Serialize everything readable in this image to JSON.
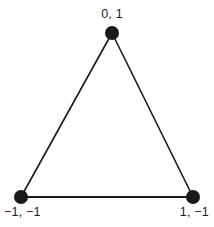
{
  "figure": {
    "name": "coordinate-triangle-diagram",
    "background_color": "#ffffff",
    "stroke_color": "#1a1a1a",
    "text_color": "#1a1a1a",
    "vertices": [
      {
        "id": "top",
        "label": "0, 1",
        "x": 112,
        "y": 33
      },
      {
        "id": "bottom-left",
        "label": "−1, −1",
        "x": 21,
        "y": 197
      },
      {
        "id": "bottom-right",
        "label": "1, −1",
        "x": 193,
        "y": 197
      }
    ],
    "edges": [
      {
        "from": "top",
        "to": "bottom-left"
      },
      {
        "from": "top",
        "to": "bottom-right"
      },
      {
        "from": "bottom-left",
        "to": "bottom-right"
      }
    ],
    "dot_radius": 7,
    "edge_width": 1.6
  }
}
